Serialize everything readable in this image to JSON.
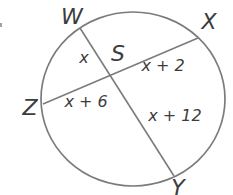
{
  "diagram": {
    "kind": "circle-with-intersecting-chords",
    "points": {
      "W": "W",
      "X": "X",
      "Y": "Y",
      "Z": "Z",
      "S": "S"
    },
    "segments": {
      "WS": "x",
      "SX": "x + 2",
      "ZS": "x + 6",
      "SY": "x + 12"
    },
    "colors": {
      "stroke": "#7b7b7b",
      "text": "#3c3c3c",
      "background": "#ffffff"
    }
  }
}
